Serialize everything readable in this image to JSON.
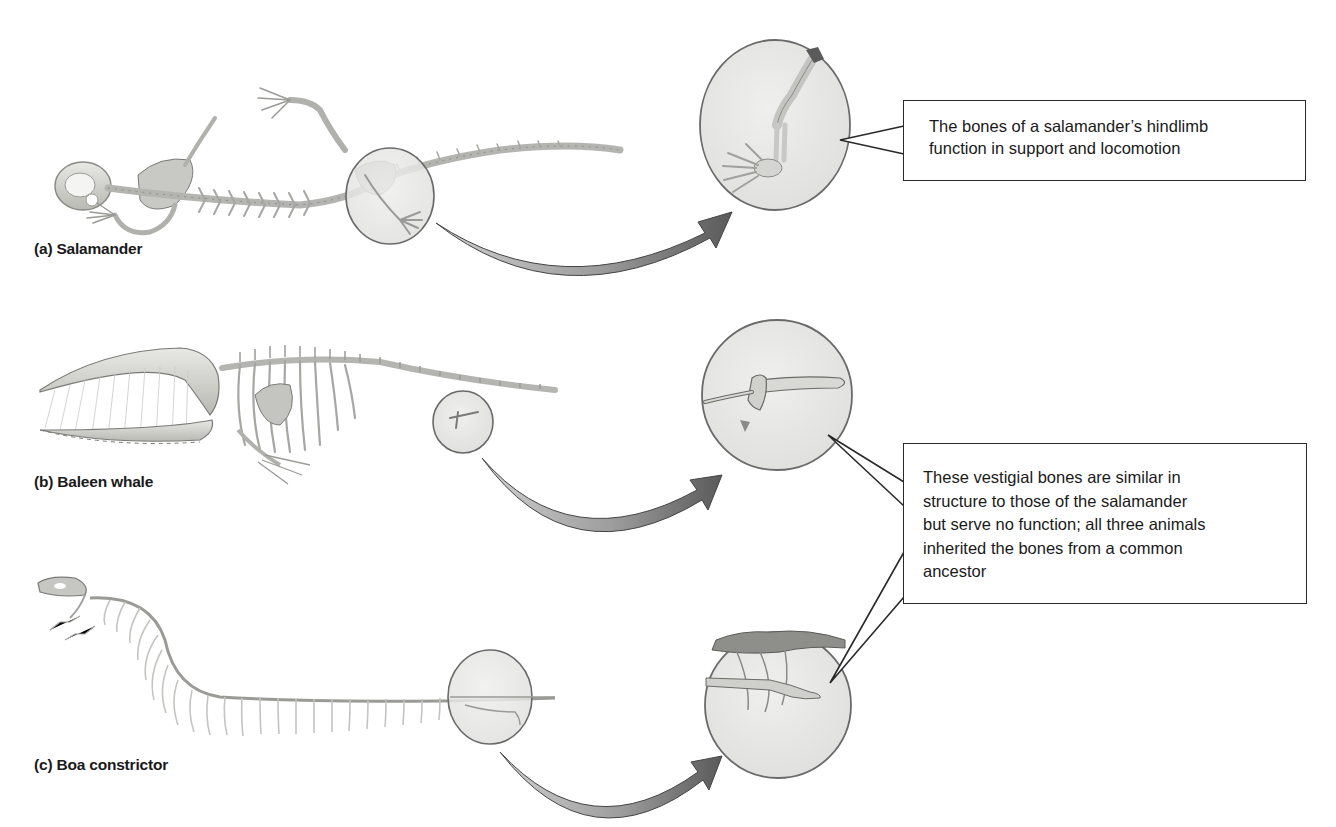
{
  "figure": {
    "panels": [
      {
        "id": "a",
        "label": "(a) Salamander",
        "structure": "hindlimb",
        "kind": "functional"
      },
      {
        "id": "b",
        "label": "(b) Baleen whale",
        "structure": "vestigial pelvis/hindlimb bones",
        "kind": "vestigial"
      },
      {
        "id": "c",
        "label": "(c) Boa constrictor",
        "structure": "vestigial hindlimb spur",
        "kind": "vestigial"
      }
    ],
    "callouts": {
      "functional": {
        "lines": [
          "The bones of a salamander’s hindlimb",
          "function in support and locomotion"
        ]
      },
      "vestigial": {
        "lines": [
          "These vestigial bones are similar in",
          "structure to those of the salamander",
          "but serve no function; all three animals",
          "inherited the bones from a common",
          "ancestor"
        ]
      }
    },
    "colors": {
      "bone": "#d9d9d4",
      "bone_shadow": "#9a9a96",
      "circle_fill": "#e6e6e4",
      "circle_stroke": "#6a6a6a",
      "arrow_light": "#b8b8b8",
      "arrow_dark": "#5e5e5e",
      "outline": "#2a2a2a",
      "text": "#1a1a1a"
    }
  }
}
